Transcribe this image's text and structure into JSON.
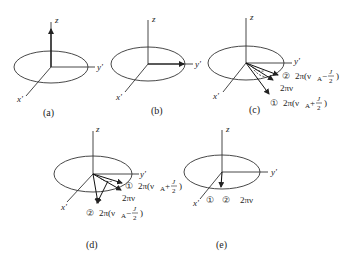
{
  "figure": {
    "panels": [
      {
        "id": "a",
        "caption": "(a)",
        "axes": {
          "z": "z",
          "y": "y'",
          "x": "x'"
        },
        "vectors": [
          "+z magnetization"
        ]
      },
      {
        "id": "b",
        "caption": "(b)",
        "axes": {
          "z": "z",
          "y": "y'",
          "x": "x'"
        },
        "vectors": [
          "along y'"
        ]
      },
      {
        "id": "c",
        "caption": "(c)",
        "axes": {
          "z": "z",
          "y": "y'",
          "x": "x'"
        },
        "labels": {
          "l2_num": "②",
          "l2_text": "2π(ν",
          "l2_sub": "A",
          "l2_tail": "−",
          "l2_frac_n": "J",
          "l2_frac_d": "2",
          "l2_close": ")",
          "mid": "2πν",
          "l1_num": "①",
          "l1_text": "2π(ν",
          "l1_sub": "A",
          "l1_tail": "+",
          "l1_frac_n": "J",
          "l1_frac_d": "2",
          "l1_close": ")"
        }
      },
      {
        "id": "d",
        "caption": "(d)",
        "axes": {
          "z": "z",
          "y": "y'",
          "x": "x'"
        },
        "labels": {
          "l1_num": "①",
          "l1_text": "2π(ν",
          "l1_sub": "A",
          "l1_tail": "+",
          "l1_frac_n": "J",
          "l1_frac_d": "2",
          "l1_close": ")",
          "mid": "2πν",
          "l2_num": "②",
          "l2_text": "2π(ν",
          "l2_sub": "A",
          "l2_tail": "−",
          "l2_frac_n": "J",
          "l2_frac_d": "2",
          "l2_close": ")"
        }
      },
      {
        "id": "e",
        "caption": "(e)",
        "axes": {
          "z": "z",
          "y": "y'",
          "x": "x'"
        },
        "labels": {
          "n1": "①",
          "n2": "②",
          "mid": "2πν"
        }
      }
    ]
  }
}
